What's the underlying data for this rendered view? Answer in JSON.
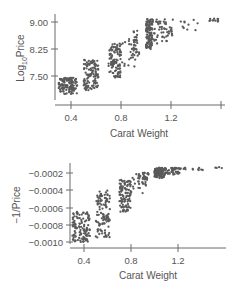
{
  "chart_data": [
    {
      "type": "scatter",
      "title": "",
      "xlabel": "Carat Weight",
      "ylabel": "Log10Price",
      "ylabel_main": "Log",
      "ylabel_sub": "10",
      "ylabel_rest": "Price",
      "xlim": [
        0.3,
        1.6
      ],
      "ylim": [
        7.0,
        9.1
      ],
      "xticks": [
        0.4,
        0.8,
        1.2,
        1.6
      ],
      "xtick_labels": [
        "0.4",
        "0.8",
        "1.2",
        ""
      ],
      "yticks": [
        7.5,
        8.25,
        9.0
      ],
      "ytick_labels": [
        "7.50",
        "8.25",
        "9.00"
      ],
      "grid": false,
      "clusters": [
        {
          "x": [
            0.3,
            0.45
          ],
          "y": [
            7.0,
            7.45
          ],
          "n": 120
        },
        {
          "x": [
            0.5,
            0.62
          ],
          "y": [
            7.1,
            7.95
          ],
          "n": 110
        },
        {
          "x": [
            0.7,
            0.8
          ],
          "y": [
            7.45,
            8.4
          ],
          "n": 100
        },
        {
          "x": [
            0.8,
            0.92
          ],
          "y": [
            7.75,
            8.55
          ],
          "n": 25
        },
        {
          "x": [
            0.9,
            0.95
          ],
          "y": [
            8.0,
            8.8
          ],
          "n": 25
        },
        {
          "x": [
            1.0,
            1.05
          ],
          "y": [
            8.25,
            9.1
          ],
          "n": 110
        },
        {
          "x": [
            1.05,
            1.22
          ],
          "y": [
            8.4,
            9.1
          ],
          "n": 55
        },
        {
          "x": [
            1.22,
            1.42
          ],
          "y": [
            8.75,
            9.1
          ],
          "n": 10
        },
        {
          "x": [
            1.5,
            1.58
          ],
          "y": [
            9.0,
            9.1
          ],
          "n": 12
        }
      ]
    },
    {
      "type": "scatter",
      "title": "",
      "xlabel": "Carat Weight",
      "ylabel": "−1/Price",
      "xlim": [
        0.3,
        1.6
      ],
      "ylim": [
        -0.00105,
        -0.00013
      ],
      "xticks": [
        0.4,
        0.8,
        1.2
      ],
      "xtick_labels": [
        "0.4",
        "0.8",
        "1.2"
      ],
      "yticks": [
        -0.0002,
        -0.0004,
        -0.0006,
        -0.0008,
        -0.001
      ],
      "ytick_labels": [
        "−0.0002",
        "−0.0004",
        "−0.0006",
        "−0.0008",
        "−0.0010"
      ],
      "grid": false,
      "clusters": [
        {
          "x": [
            0.3,
            0.45
          ],
          "y": [
            -0.001,
            -0.00065
          ],
          "n": 120
        },
        {
          "x": [
            0.5,
            0.62
          ],
          "y": [
            -0.00095,
            -0.0004
          ],
          "n": 110
        },
        {
          "x": [
            0.7,
            0.8
          ],
          "y": [
            -0.00065,
            -0.00028
          ],
          "n": 100
        },
        {
          "x": [
            0.8,
            0.92
          ],
          "y": [
            -0.00045,
            -0.0002
          ],
          "n": 25
        },
        {
          "x": [
            0.9,
            0.95
          ],
          "y": [
            -0.00035,
            -0.00018
          ],
          "n": 25
        },
        {
          "x": [
            1.0,
            1.08
          ],
          "y": [
            -0.00026,
            -0.00014
          ],
          "n": 110
        },
        {
          "x": [
            1.08,
            1.22
          ],
          "y": [
            -0.00022,
            -0.00014
          ],
          "n": 45
        },
        {
          "x": [
            1.22,
            1.42
          ],
          "y": [
            -0.00018,
            -0.00014
          ],
          "n": 12
        },
        {
          "x": [
            1.5,
            1.58
          ],
          "y": [
            -0.00015,
            -0.00013
          ],
          "n": 4
        }
      ]
    }
  ]
}
